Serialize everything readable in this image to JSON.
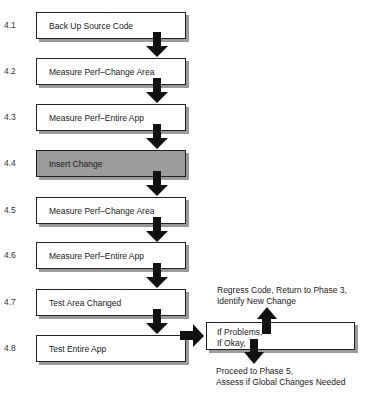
{
  "steps": [
    {
      "number": "4.1",
      "label": "Back Up Source Code",
      "shaded": false
    },
    {
      "number": "4.2",
      "label": "Measure Perf–Change Area",
      "shaded": false
    },
    {
      "number": "4.3",
      "label": "Measure Perf–Entire App",
      "shaded": false
    },
    {
      "number": "4.4",
      "label": "Insert Change",
      "shaded": true
    },
    {
      "number": "4.5",
      "label": "Measure Perf–Change Area",
      "shaded": false
    },
    {
      "number": "4.6",
      "label": "Measure Perf–Entire App",
      "shaded": false
    },
    {
      "number": "4.7",
      "label": "Test Area Changed",
      "shaded": false
    },
    {
      "number": "4.8",
      "label": "Test Entire App",
      "shaded": false
    }
  ],
  "decision": {
    "line1": "If Problems,",
    "line2": "If Okay,"
  },
  "outcomes": {
    "problems": {
      "line1": "Regress Code, Return to Phase 3,",
      "line2": "Identify New Change"
    },
    "okay": {
      "line1": "Proceed to Phase 5,",
      "line2": "Assess if Global Changes Needed"
    }
  },
  "colors": {
    "shaded_fill": "#9b9b9b",
    "shadow": "#9a9a9a",
    "arrow": "#111111"
  }
}
